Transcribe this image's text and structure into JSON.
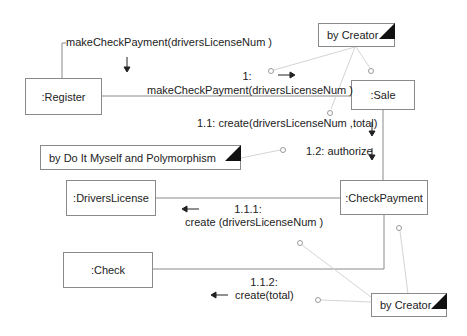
{
  "diagram": {
    "type": "UML collaboration diagram",
    "objects": [
      {
        "id": "register",
        "label": ":Register"
      },
      {
        "id": "sale",
        "label": ":Sale"
      },
      {
        "id": "drivers_license",
        "label": ":DriversLicense"
      },
      {
        "id": "check_payment",
        "label": ":CheckPayment"
      },
      {
        "id": "check",
        "label": ":Check"
      }
    ],
    "notes": [
      {
        "id": "note_top",
        "text": "by Creator"
      },
      {
        "id": "note_mid",
        "text": "by Do It Myself and Polymorphism"
      },
      {
        "id": "note_bottom",
        "text": "by Creator"
      }
    ],
    "messages": {
      "entry": "makeCheckPayment(driversLicenseNum )",
      "m1_num": "1:",
      "m1_text": "makeCheckPayment(driversLicenseNum )",
      "m1_1": "1.1: create(driversLicenseNum ,total)",
      "m1_2": "1.2: authorize",
      "m1_1_1_num": "1.1.1:",
      "m1_1_1_text": "create (driversLicenseNum )",
      "m1_1_2_num": "1.1.2:",
      "m1_1_2_text": "create(total)"
    },
    "colors": {
      "box_border": "#8a8a8a",
      "link_line": "#8a8a8a",
      "note_connector": "#d0d0d0",
      "fold_fill": "#111111",
      "text": "#222222"
    }
  }
}
